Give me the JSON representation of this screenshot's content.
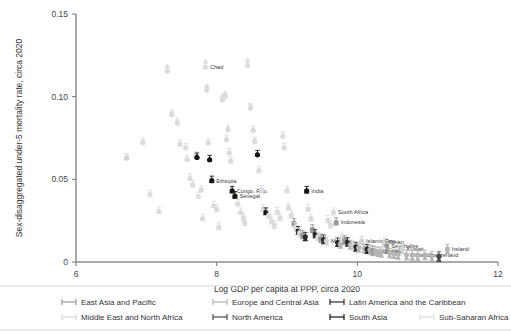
{
  "chart_data": {
    "type": "scatter",
    "title": "",
    "xlabel": "Log GDP per capita at PPP, circa 2020",
    "ylabel": "Sex-disaggregated under-5 mortality rate, circa 2020",
    "xlim": [
      6,
      12
    ],
    "ylim": [
      0,
      0.15
    ],
    "xticks": [
      "6",
      "8",
      "10",
      "12"
    ],
    "xtick_values": [
      6,
      8,
      10,
      12
    ],
    "yticks": [
      "0",
      "0.05",
      "0.10",
      "0.15"
    ],
    "ytick_values": [
      0,
      0.05,
      0.1,
      0.15
    ],
    "grid": false,
    "legend_position": "bottom",
    "marker_note": "each observation drawn as a circle (female rate) joined by a vertical line to a triangle (male rate)",
    "series": [
      {
        "name": "East Asia and Pacific",
        "color": "#9a9a9a"
      },
      {
        "name": "Europe and Central Asia",
        "color": "#b5b5b5"
      },
      {
        "name": "Latin America and the Caribbean",
        "color": "#2b2b2b"
      },
      {
        "name": "Middle East and North Africa",
        "color": "#d2d2d2"
      },
      {
        "name": "North America",
        "color": "#4a4a4a"
      },
      {
        "name": "South Asia",
        "color": "#151515"
      },
      {
        "name": "Sub-Saharan Africa",
        "color": "#dcdcdc"
      }
    ],
    "points": [
      {
        "x": 6.72,
        "yf": 0.0628,
        "ym": 0.066,
        "region": 3,
        "label": ""
      },
      {
        "x": 6.95,
        "yf": 0.0722,
        "ym": 0.076,
        "region": 6,
        "label": ""
      },
      {
        "x": 7.05,
        "yf": 0.0408,
        "ym": 0.0438,
        "region": 6,
        "label": ""
      },
      {
        "x": 7.18,
        "yf": 0.0306,
        "ym": 0.033,
        "region": 6,
        "label": ""
      },
      {
        "x": 7.3,
        "yf": 0.1153,
        "ym": 0.121,
        "region": 6,
        "label": ""
      },
      {
        "x": 7.36,
        "yf": 0.089,
        "ym": 0.0935,
        "region": 6,
        "label": ""
      },
      {
        "x": 7.44,
        "yf": 0.084,
        "ym": 0.0882,
        "region": 6,
        "label": ""
      },
      {
        "x": 7.48,
        "yf": 0.0712,
        "ym": 0.0748,
        "region": 6,
        "label": ""
      },
      {
        "x": 7.56,
        "yf": 0.069,
        "ym": 0.0724,
        "region": 6,
        "label": ""
      },
      {
        "x": 7.58,
        "yf": 0.062,
        "ym": 0.0652,
        "region": 6,
        "label": ""
      },
      {
        "x": 7.62,
        "yf": 0.0505,
        "ym": 0.0538,
        "region": 6,
        "label": ""
      },
      {
        "x": 7.66,
        "yf": 0.0466,
        "ym": 0.0492,
        "region": 6,
        "label": ""
      },
      {
        "x": 7.7,
        "yf": 0.064,
        "ym": 0.0676,
        "region": 6,
        "label": ""
      },
      {
        "x": 7.72,
        "yf": 0.0632,
        "ym": 0.0666,
        "region": 5,
        "label": ""
      },
      {
        "x": 7.74,
        "yf": 0.0396,
        "ym": 0.0424,
        "region": 6,
        "label": ""
      },
      {
        "x": 7.78,
        "yf": 0.0436,
        "ym": 0.0462,
        "region": 6,
        "label": ""
      },
      {
        "x": 7.8,
        "yf": 0.0262,
        "ym": 0.0288,
        "region": 6,
        "label": ""
      },
      {
        "x": 7.84,
        "yf": 0.1178,
        "ym": 0.124,
        "region": 6,
        "label": "Chad"
      },
      {
        "x": 7.86,
        "yf": 0.104,
        "ym": 0.1092,
        "region": 6,
        "label": ""
      },
      {
        "x": 7.88,
        "yf": 0.072,
        "ym": 0.0752,
        "region": 6,
        "label": ""
      },
      {
        "x": 7.9,
        "yf": 0.0618,
        "ym": 0.065,
        "region": 5,
        "label": ""
      },
      {
        "x": 7.93,
        "yf": 0.0492,
        "ym": 0.052,
        "region": 5,
        "label": "Ethiopia"
      },
      {
        "x": 7.96,
        "yf": 0.034,
        "ym": 0.0366,
        "region": 6,
        "label": ""
      },
      {
        "x": 8.0,
        "yf": 0.032,
        "ym": 0.0344,
        "region": 6,
        "label": ""
      },
      {
        "x": 8.03,
        "yf": 0.021,
        "ym": 0.0232,
        "region": 6,
        "label": ""
      },
      {
        "x": 8.08,
        "yf": 0.098,
        "ym": 0.103,
        "region": 6,
        "label": ""
      },
      {
        "x": 8.12,
        "yf": 0.1,
        "ym": 0.1048,
        "region": 6,
        "label": ""
      },
      {
        "x": 8.14,
        "yf": 0.074,
        "ym": 0.0776,
        "region": 6,
        "label": ""
      },
      {
        "x": 8.16,
        "yf": 0.08,
        "ym": 0.0838,
        "region": 6,
        "label": ""
      },
      {
        "x": 8.18,
        "yf": 0.066,
        "ym": 0.0692,
        "region": 6,
        "label": ""
      },
      {
        "x": 8.2,
        "yf": 0.061,
        "ym": 0.0642,
        "region": 6,
        "label": ""
      },
      {
        "x": 8.22,
        "yf": 0.043,
        "ym": 0.0456,
        "region": 5,
        "label": "Congo, Rep."
      },
      {
        "x": 8.26,
        "yf": 0.0398,
        "ym": 0.0422,
        "region": 5,
        "label": "Senegal"
      },
      {
        "x": 8.3,
        "yf": 0.0352,
        "ym": 0.0376,
        "region": 6,
        "label": ""
      },
      {
        "x": 8.34,
        "yf": 0.03,
        "ym": 0.0324,
        "region": 6,
        "label": ""
      },
      {
        "x": 8.38,
        "yf": 0.0268,
        "ym": 0.029,
        "region": 6,
        "label": ""
      },
      {
        "x": 8.4,
        "yf": 0.0238,
        "ym": 0.0258,
        "region": 6,
        "label": ""
      },
      {
        "x": 8.44,
        "yf": 0.119,
        "ym": 0.1248,
        "region": 6,
        "label": ""
      },
      {
        "x": 8.48,
        "yf": 0.093,
        "ym": 0.0974,
        "region": 6,
        "label": ""
      },
      {
        "x": 8.52,
        "yf": 0.0795,
        "ym": 0.0834,
        "region": 6,
        "label": ""
      },
      {
        "x": 8.54,
        "yf": 0.0728,
        "ym": 0.0764,
        "region": 6,
        "label": ""
      },
      {
        "x": 8.58,
        "yf": 0.0648,
        "ym": 0.068,
        "region": 5,
        "label": ""
      },
      {
        "x": 8.6,
        "yf": 0.0552,
        "ym": 0.0582,
        "region": 6,
        "label": ""
      },
      {
        "x": 8.64,
        "yf": 0.0436,
        "ym": 0.046,
        "region": 6,
        "label": ""
      },
      {
        "x": 8.66,
        "yf": 0.032,
        "ym": 0.0344,
        "region": 6,
        "label": ""
      },
      {
        "x": 8.7,
        "yf": 0.03,
        "ym": 0.0322,
        "region": 5,
        "label": ""
      },
      {
        "x": 8.74,
        "yf": 0.0282,
        "ym": 0.0302,
        "region": 6,
        "label": ""
      },
      {
        "x": 8.78,
        "yf": 0.0246,
        "ym": 0.0266,
        "region": 6,
        "label": ""
      },
      {
        "x": 8.82,
        "yf": 0.0222,
        "ym": 0.024,
        "region": 6,
        "label": ""
      },
      {
        "x": 8.86,
        "yf": 0.0302,
        "ym": 0.0324,
        "region": 6,
        "label": ""
      },
      {
        "x": 8.9,
        "yf": 0.0268,
        "ym": 0.0288,
        "region": 6,
        "label": ""
      },
      {
        "x": 8.94,
        "yf": 0.076,
        "ym": 0.0796,
        "region": 6,
        "label": ""
      },
      {
        "x": 8.96,
        "yf": 0.069,
        "ym": 0.0722,
        "region": 6,
        "label": ""
      },
      {
        "x": 9.0,
        "yf": 0.0432,
        "ym": 0.0456,
        "region": 6,
        "label": ""
      },
      {
        "x": 9.02,
        "yf": 0.033,
        "ym": 0.0352,
        "region": 6,
        "label": ""
      },
      {
        "x": 9.06,
        "yf": 0.0284,
        "ym": 0.0304,
        "region": 6,
        "label": ""
      },
      {
        "x": 9.1,
        "yf": 0.0235,
        "ym": 0.0254,
        "region": 0,
        "label": ""
      },
      {
        "x": 9.12,
        "yf": 0.021,
        "ym": 0.0228,
        "region": 6,
        "label": ""
      },
      {
        "x": 9.16,
        "yf": 0.0188,
        "ym": 0.0204,
        "region": 2,
        "label": ""
      },
      {
        "x": 9.18,
        "yf": 0.0176,
        "ym": 0.0192,
        "region": 6,
        "label": ""
      },
      {
        "x": 9.22,
        "yf": 0.0162,
        "ym": 0.0178,
        "region": 0,
        "label": ""
      },
      {
        "x": 9.26,
        "yf": 0.0152,
        "ym": 0.0166,
        "region": 2,
        "label": ""
      },
      {
        "x": 9.28,
        "yf": 0.043,
        "ym": 0.0454,
        "region": 5,
        "label": "India"
      },
      {
        "x": 9.3,
        "yf": 0.0322,
        "ym": 0.0344,
        "region": 6,
        "label": ""
      },
      {
        "x": 9.34,
        "yf": 0.0262,
        "ym": 0.0282,
        "region": 6,
        "label": ""
      },
      {
        "x": 9.36,
        "yf": 0.0198,
        "ym": 0.0216,
        "region": 0,
        "label": ""
      },
      {
        "x": 9.4,
        "yf": 0.0168,
        "ym": 0.0184,
        "region": 2,
        "label": ""
      },
      {
        "x": 9.44,
        "yf": 0.0152,
        "ym": 0.0166,
        "region": 6,
        "label": ""
      },
      {
        "x": 9.48,
        "yf": 0.0142,
        "ym": 0.0156,
        "region": 0,
        "label": ""
      },
      {
        "x": 9.52,
        "yf": 0.0136,
        "ym": 0.0148,
        "region": 2,
        "label": ""
      },
      {
        "x": 9.56,
        "yf": 0.0128,
        "ym": 0.014,
        "region": 3,
        "label": "Morocco"
      },
      {
        "x": 9.58,
        "yf": 0.0254,
        "ym": 0.0274,
        "region": 6,
        "label": ""
      },
      {
        "x": 9.62,
        "yf": 0.0224,
        "ym": 0.0242,
        "region": 6,
        "label": ""
      },
      {
        "x": 9.66,
        "yf": 0.03,
        "ym": 0.0322,
        "region": 6,
        "label": "South Africa"
      },
      {
        "x": 9.7,
        "yf": 0.024,
        "ym": 0.026,
        "region": 0,
        "label": "Indonesia"
      },
      {
        "x": 9.72,
        "yf": 0.0118,
        "ym": 0.013,
        "region": 2,
        "label": ""
      },
      {
        "x": 9.76,
        "yf": 0.0108,
        "ym": 0.012,
        "region": 1,
        "label": ""
      },
      {
        "x": 9.78,
        "yf": 0.0146,
        "ym": 0.016,
        "region": 6,
        "label": ""
      },
      {
        "x": 9.82,
        "yf": 0.0132,
        "ym": 0.0144,
        "region": 0,
        "label": ""
      },
      {
        "x": 9.86,
        "yf": 0.012,
        "ym": 0.0132,
        "region": 2,
        "label": ""
      },
      {
        "x": 9.9,
        "yf": 0.0104,
        "ym": 0.0116,
        "region": 1,
        "label": ""
      },
      {
        "x": 9.94,
        "yf": 0.0098,
        "ym": 0.0108,
        "region": 3,
        "label": ""
      },
      {
        "x": 9.98,
        "yf": 0.0092,
        "ym": 0.0102,
        "region": 2,
        "label": ""
      },
      {
        "x": 10.02,
        "yf": 0.0086,
        "ym": 0.0096,
        "region": 1,
        "label": ""
      },
      {
        "x": 10.06,
        "yf": 0.0126,
        "ym": 0.0138,
        "region": 3,
        "label": "Islamic Rep."
      },
      {
        "x": 10.1,
        "yf": 0.0082,
        "ym": 0.0092,
        "region": 1,
        "label": ""
      },
      {
        "x": 10.14,
        "yf": 0.0078,
        "ym": 0.0088,
        "region": 2,
        "label": ""
      },
      {
        "x": 10.18,
        "yf": 0.0074,
        "ym": 0.0082,
        "region": 1,
        "label": ""
      },
      {
        "x": 10.22,
        "yf": 0.007,
        "ym": 0.0078,
        "region": 0,
        "label": ""
      },
      {
        "x": 10.26,
        "yf": 0.0066,
        "ym": 0.0074,
        "region": 1,
        "label": "Hungary"
      },
      {
        "x": 10.3,
        "yf": 0.0062,
        "ym": 0.007,
        "region": 1,
        "label": "Greece"
      },
      {
        "x": 10.34,
        "yf": 0.0058,
        "ym": 0.0066,
        "region": 1,
        "label": "Croatia"
      },
      {
        "x": 10.38,
        "yf": 0.0118,
        "ym": 0.013,
        "region": 3,
        "label": "Oman"
      },
      {
        "x": 10.42,
        "yf": 0.0098,
        "ym": 0.0108,
        "region": 0,
        "label": "Seychelles"
      },
      {
        "x": 10.46,
        "yf": 0.0054,
        "ym": 0.0062,
        "region": 1,
        "label": ""
      },
      {
        "x": 10.52,
        "yf": 0.005,
        "ym": 0.0058,
        "region": 1,
        "label": ""
      },
      {
        "x": 10.58,
        "yf": 0.0048,
        "ym": 0.0054,
        "region": 1,
        "label": ""
      },
      {
        "x": 10.64,
        "yf": 0.0076,
        "ym": 0.0086,
        "region": 3,
        "label": "Kuwait"
      },
      {
        "x": 10.7,
        "yf": 0.0044,
        "ym": 0.005,
        "region": 1,
        "label": "Finland"
      },
      {
        "x": 10.78,
        "yf": 0.0042,
        "ym": 0.0048,
        "region": 1,
        "label": ""
      },
      {
        "x": 10.86,
        "yf": 0.004,
        "ym": 0.0046,
        "region": 1,
        "label": ""
      },
      {
        "x": 10.96,
        "yf": 0.0044,
        "ym": 0.005,
        "region": 1,
        "label": "Switzerland"
      },
      {
        "x": 11.06,
        "yf": 0.0036,
        "ym": 0.0042,
        "region": 1,
        "label": ""
      },
      {
        "x": 11.16,
        "yf": 0.0034,
        "ym": 0.004,
        "region": 4,
        "label": ""
      },
      {
        "x": 11.28,
        "yf": 0.008,
        "ym": 0.009,
        "region": 1,
        "label": "Ireland"
      }
    ]
  },
  "legend": {
    "items": [
      {
        "label": "East Asia and Pacific",
        "color": "#9a9a9a"
      },
      {
        "label": "Europe and Central Asia",
        "color": "#b5b5b5"
      },
      {
        "label": "Latin America and the Caribbean",
        "color": "#2b2b2b"
      },
      {
        "label": "Middle East and North Africa",
        "color": "#d2d2d2"
      },
      {
        "label": "North America",
        "color": "#4a4a4a"
      },
      {
        "label": "South Asia",
        "color": "#151515"
      },
      {
        "label": "Sub-Saharan Africa",
        "color": "#dcdcdc"
      }
    ]
  }
}
